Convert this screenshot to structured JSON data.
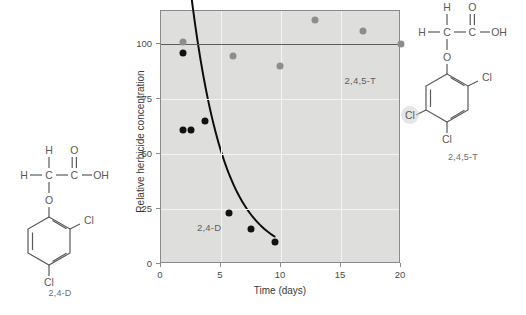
{
  "figure": {
    "background_color": "#ffffff",
    "plot_background_color": "#dededd",
    "grid_color": "#f4f4f4",
    "axis_color": "#8a8a8a"
  },
  "chart_data": {
    "type": "scatter",
    "title": "",
    "xlabel": "Time (days)",
    "ylabel": "Relative herbicide concentration",
    "xlim": [
      0,
      20
    ],
    "ylim": [
      0,
      115
    ],
    "xticks": [
      0,
      5,
      10,
      15,
      20
    ],
    "yticks": [
      0,
      25,
      50,
      75,
      100
    ],
    "xticklabels": [
      "0",
      "5",
      "10",
      "15",
      "20"
    ],
    "yticklabels": [
      "0",
      "25",
      "50",
      "75",
      "100"
    ],
    "grid": true,
    "legend": "inline-annotations",
    "reference_line": {
      "y": 100,
      "color": "#5d5d5d",
      "label": "100% reference"
    },
    "series": [
      {
        "name": "2,4-D",
        "marker_color": "#111111",
        "has_fit_curve": true,
        "fit_type": "exponential decay",
        "points": [
          {
            "x": 1.8,
            "y": 96
          },
          {
            "x": 1.8,
            "y": 61
          },
          {
            "x": 2.5,
            "y": 61
          },
          {
            "x": 3.7,
            "y": 65
          },
          {
            "x": 5.7,
            "y": 23
          },
          {
            "x": 7.5,
            "y": 16
          },
          {
            "x": 9.5,
            "y": 10
          }
        ]
      },
      {
        "name": "2,4,5-T",
        "marker_color": "#8d8d8d",
        "has_fit_curve": false,
        "points": [
          {
            "x": 1.8,
            "y": 101
          },
          {
            "x": 6.0,
            "y": 94.5
          },
          {
            "x": 9.9,
            "y": 90
          },
          {
            "x": 12.8,
            "y": 111
          },
          {
            "x": 16.8,
            "y": 106
          },
          {
            "x": 20.0,
            "y": 100
          }
        ]
      }
    ],
    "annotations": [
      {
        "text": "2,4-D",
        "x": 3.0,
        "y": 19,
        "color": "#5f5f5f"
      },
      {
        "text": "2,4,5-T",
        "x": 15.3,
        "y": 86,
        "color": "#5f5f5f"
      }
    ]
  },
  "structures": [
    {
      "id": "structure-24d",
      "caption": "2,4-D",
      "atoms": {
        "h_top": "H",
        "h_left": "H",
        "c_alpha": "C",
        "c_carboxyl": "C",
        "o_double": "O",
        "oh": "OH",
        "o_ether": "O",
        "cl_ortho": "Cl",
        "cl_para": "Cl"
      }
    },
    {
      "id": "structure-245t",
      "caption": "2,4,5-T",
      "atoms": {
        "h_top": "H",
        "h_left": "H",
        "c_alpha": "C",
        "c_carboxyl": "C",
        "o_double": "O",
        "oh": "OH",
        "o_ether": "O",
        "cl_ortho": "Cl",
        "cl_para": "Cl",
        "cl_meta": "Cl"
      }
    }
  ]
}
